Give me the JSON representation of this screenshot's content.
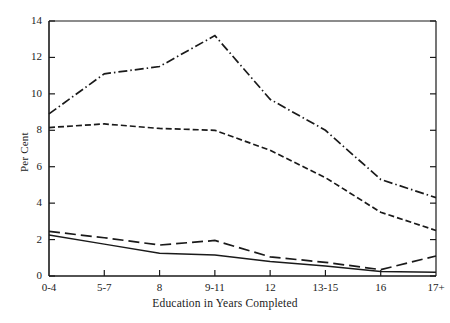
{
  "chart_data": {
    "type": "line",
    "title": "",
    "subtitle": "",
    "xlabel": "Education in Years Completed",
    "ylabel": "Per Cent",
    "categories": [
      "0-4",
      "5-7",
      "8",
      "9-11",
      "12",
      "13-15",
      "16",
      "17+"
    ],
    "x_tick_labels": [
      "0-4",
      "5-7",
      "8",
      "9-11",
      "12",
      "13-15",
      "16",
      "17+"
    ],
    "y_tick_labels": [
      "0",
      "2",
      "4",
      "6",
      "8",
      "10",
      "12",
      "14"
    ],
    "y_ticks": [
      0,
      2,
      4,
      6,
      8,
      10,
      12,
      14
    ],
    "ylim": [
      0,
      14
    ],
    "grid": false,
    "legend": "none",
    "line_color": "#1a1a1a",
    "series": [
      {
        "name": "series-1",
        "style": "dash-dot",
        "dasharray": "9,3,1.5,3",
        "values": [
          8.9,
          11.1,
          11.5,
          13.2,
          9.7,
          8.0,
          5.3,
          4.3
        ]
      },
      {
        "name": "series-2",
        "style": "dashed",
        "dasharray": "6,3",
        "values": [
          8.15,
          8.35,
          8.1,
          8.0,
          6.9,
          5.4,
          3.5,
          2.5
        ]
      },
      {
        "name": "series-3",
        "style": "long-dash",
        "dasharray": "11,5",
        "values": [
          2.45,
          2.1,
          1.7,
          1.95,
          1.05,
          0.75,
          0.35,
          1.1
        ]
      },
      {
        "name": "series-4",
        "style": "solid",
        "dasharray": "0",
        "values": [
          2.25,
          1.75,
          1.25,
          1.15,
          0.8,
          0.55,
          0.25,
          0.2
        ]
      }
    ]
  },
  "axes": {
    "x_start_px": 49,
    "x_end_px": 436,
    "y_zero_px": 276,
    "y_top_px": 21
  }
}
